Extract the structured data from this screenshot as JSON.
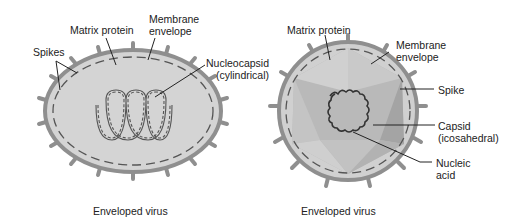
{
  "figure": {
    "left_virus": {
      "caption": "Enveloped virus",
      "labels": {
        "spikes": "Spikes",
        "matrix_protein": "Matrix protein",
        "membrane_line1": "Membrane",
        "membrane_line2": "envelope",
        "nucleocapsid_line1": "Nucleocapsid",
        "nucleocapsid_line2": "(cylindrical)"
      }
    },
    "right_virus": {
      "caption": "Enveloped virus",
      "labels": {
        "matrix_protein": "Matrix protein",
        "membrane_line1": "Membrane",
        "membrane_line2": "envelope",
        "spike": "Spike",
        "capsid_line1": "Capsid",
        "capsid_line2": "(icosahedral)",
        "nucleic_line1": "Nucleic",
        "nucleic_line2": "acid"
      }
    },
    "colors": {
      "envelope": "#8f8f8f",
      "interior": "#d4d4d4",
      "capsid_light": "#c4c4c4",
      "capsid_dark": "#a9a9a9",
      "leader": "#222222"
    }
  }
}
